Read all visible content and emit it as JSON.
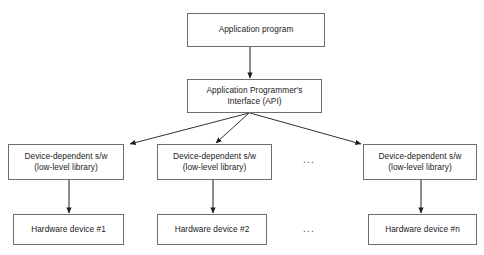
{
  "diagram": {
    "stroke_color": "#6d6d6d",
    "arrow_color": "#1b1b1b",
    "background_color": "#ffffff",
    "nodes": {
      "application_program": {
        "label": "Application program"
      },
      "api": {
        "line1": "Application Programmer's",
        "line2": "Interface (API)"
      },
      "device_sw_1": {
        "line1": "Device-dependent s/w",
        "line2": "(low-level library)"
      },
      "device_sw_2": {
        "line1": "Device-dependent s/w",
        "line2": "(low-level library)"
      },
      "device_sw_n": {
        "line1": "Device-dependent s/w",
        "line2": "(low-level library)"
      },
      "hardware_1": {
        "label": "Hardware device #1"
      },
      "hardware_2": {
        "label": "Hardware device #2"
      },
      "hardware_n": {
        "label": "Hardware device #n"
      }
    },
    "ellipses": {
      "devices_row": "...",
      "hardware_row": "..."
    }
  }
}
